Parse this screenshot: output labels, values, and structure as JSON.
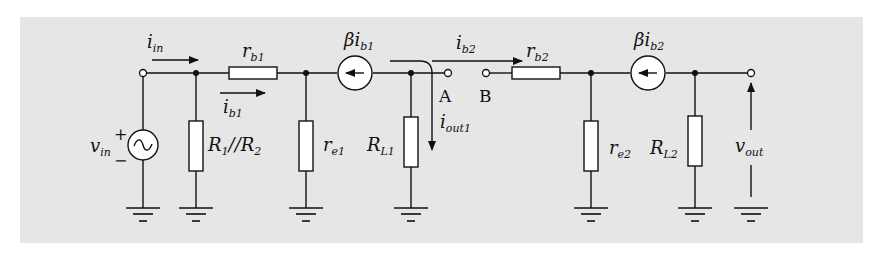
{
  "diagram": {
    "background_color": "#e6e6e6",
    "line_color": "#111111",
    "labels": {
      "i_in": {
        "base": "i",
        "sub": "in"
      },
      "r_b1": {
        "base": "r",
        "sub": "b1"
      },
      "i_b1": {
        "base": "i",
        "sub": "b1"
      },
      "beta_ib1": {
        "base": "βi",
        "sub": "b1"
      },
      "i_b2": {
        "base": "i",
        "sub": "b2"
      },
      "r_b2": {
        "base": "r",
        "sub": "b2"
      },
      "beta_ib2": {
        "base": "βi",
        "sub": "b2"
      },
      "v_in": {
        "base": "v",
        "sub": "in"
      },
      "v_in_plus": "+",
      "v_in_minus": "−",
      "R1_R2": {
        "R1": "R",
        "R1_sub": "1",
        "sep": "//",
        "R2": "R",
        "R2_sub": "2"
      },
      "r_e1": {
        "base": "r",
        "sub": "e1"
      },
      "R_L1": {
        "base": "R",
        "sub": "L1"
      },
      "i_out1": {
        "base": "i",
        "sub": "out1"
      },
      "node_A": "A",
      "node_B": "B",
      "r_e2": {
        "base": "r",
        "sub": "e2"
      },
      "R_L2": {
        "base": "R",
        "sub": "L2"
      },
      "v_out": {
        "base": "v",
        "sub": "out"
      }
    },
    "components": [
      {
        "id": "vin",
        "type": "ac-voltage-source",
        "label": "v_in"
      },
      {
        "id": "R1R2",
        "type": "resistor",
        "orientation": "vertical",
        "label": "R1//R2"
      },
      {
        "id": "rb1",
        "type": "resistor",
        "orientation": "horizontal",
        "label": "r_b1"
      },
      {
        "id": "re1",
        "type": "resistor",
        "orientation": "vertical",
        "label": "r_e1"
      },
      {
        "id": "cs1",
        "type": "current-source",
        "direction": "left",
        "label": "βi_b1"
      },
      {
        "id": "RL1",
        "type": "resistor",
        "orientation": "vertical",
        "label": "R_L1"
      },
      {
        "id": "A",
        "type": "terminal",
        "label": "A"
      },
      {
        "id": "B",
        "type": "terminal",
        "label": "B"
      },
      {
        "id": "rb2",
        "type": "resistor",
        "orientation": "horizontal",
        "label": "r_b2"
      },
      {
        "id": "re2",
        "type": "resistor",
        "orientation": "vertical",
        "label": "r_e2"
      },
      {
        "id": "cs2",
        "type": "current-source",
        "direction": "left",
        "label": "βi_b2"
      },
      {
        "id": "RL2",
        "type": "resistor",
        "orientation": "vertical",
        "label": "R_L2"
      },
      {
        "id": "vout",
        "type": "output-terminal",
        "label": "v_out"
      }
    ]
  }
}
